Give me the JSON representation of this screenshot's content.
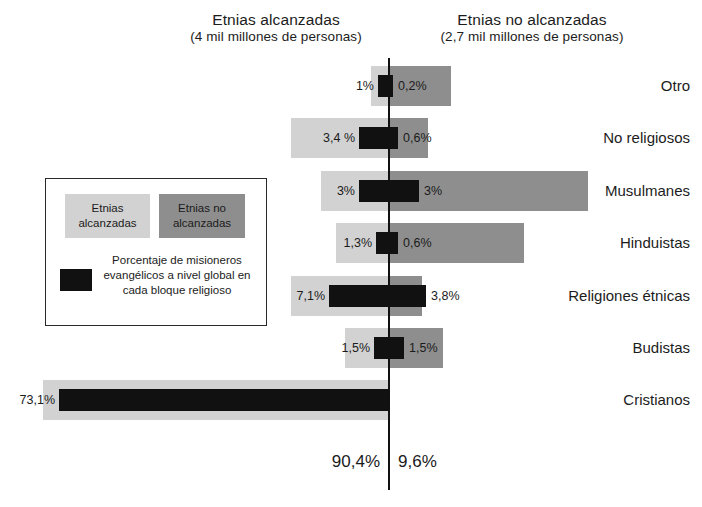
{
  "header": {
    "left": {
      "title": "Etnias alcanzadas",
      "subtitle": "(4 mil millones de personas)"
    },
    "right": {
      "title": "Etnias no alcanzadas",
      "subtitle": "(2,7 mil millones de personas)"
    }
  },
  "legend": {
    "swatch_reached_label": "Etnias alcanzadas",
    "swatch_unreached_label": "Etnias no alcanzadas",
    "missionary_note": "Porcentaje de misioneros evangélicos a nivel global en cada bloque religioso"
  },
  "totals": {
    "left": "90,4%",
    "right": "9,6%"
  },
  "colors": {
    "reached": "#d2d2d2",
    "unreached": "#8e8e8e",
    "missionary": "#111111",
    "axis": "#111111",
    "text": "#1b1b1b"
  },
  "rows": [
    {
      "label": "Otro",
      "left_value": "1%",
      "right_value": "0,2%",
      "reached_px": 18,
      "unreached_px": 62,
      "missionary_left_px": 11,
      "missionary_right_px": 4
    },
    {
      "label": "No religiosos",
      "left_value": "3,4 %",
      "right_value": "0,6%",
      "reached_px": 98,
      "unreached_px": 39,
      "missionary_left_px": 30,
      "missionary_right_px": 9
    },
    {
      "label": "Musulmanes",
      "left_value": "3%",
      "right_value": "3%",
      "reached_px": 68,
      "unreached_px": 199,
      "missionary_left_px": 30,
      "missionary_right_px": 30
    },
    {
      "label": "Hinduistas",
      "left_value": "1,3%",
      "right_value": "0,6%",
      "reached_px": 53,
      "unreached_px": 135,
      "missionary_left_px": 13,
      "missionary_right_px": 9
    },
    {
      "label": "Religiones étnicas",
      "left_value": "7,1%",
      "right_value": "3,8%",
      "reached_px": 98,
      "unreached_px": 33,
      "missionary_left_px": 60,
      "missionary_right_px": 37
    },
    {
      "label": "Budistas",
      "left_value": "1,5%",
      "right_value": "1,5%",
      "reached_px": 44,
      "unreached_px": 54,
      "missionary_left_px": 15,
      "missionary_right_px": 15
    },
    {
      "label": "Cristianos",
      "left_value": "73,1%",
      "right_value": "",
      "reached_px": 346,
      "unreached_px": 0,
      "missionary_left_px": 330,
      "missionary_right_px": 0
    }
  ],
  "chart_data": {
    "type": "bar",
    "subtitle": "Porcentaje de misioneros evangélicos a nivel global en cada bloque religioso",
    "orientation": "horizontal-diverging",
    "categories": [
      "Otro",
      "No religiosos",
      "Musulmanes",
      "Hinduistas",
      "Religiones étnicas",
      "Budistas",
      "Cristianos"
    ],
    "series": [
      {
        "name": "Misioneros evangélicos - Etnias alcanzadas",
        "side": "left",
        "unit": "%",
        "values": [
          1,
          3.4,
          3,
          1.3,
          7.1,
          1.5,
          73.1
        ],
        "labels": [
          "1%",
          "3,4 %",
          "3%",
          "1,3%",
          "7,1%",
          "1,5%",
          "73,1%"
        ]
      },
      {
        "name": "Misioneros evangélicos - Etnias no alcanzadas",
        "side": "right",
        "unit": "%",
        "values": [
          0.2,
          0.6,
          3,
          0.6,
          3.8,
          1.5,
          null
        ],
        "labels": [
          "0,2%",
          "0,6%",
          "3%",
          "0,6%",
          "3,8%",
          "1,5%",
          ""
        ]
      }
    ],
    "totals": {
      "Etnias alcanzadas": "90,4%",
      "Etnias no alcanzadas": "9,6%"
    },
    "population": {
      "Etnias alcanzadas": "4 mil millones de personas",
      "Etnias no alcanzadas": "2,7 mil millones de personas"
    },
    "legend": [
      "Etnias alcanzadas",
      "Etnias no alcanzadas",
      "Porcentaje de misioneros evangélicos a nivel global en cada bloque religioso"
    ],
    "xlabel": "",
    "ylabel": "",
    "grid": false,
    "legend_position": "left-center"
  }
}
